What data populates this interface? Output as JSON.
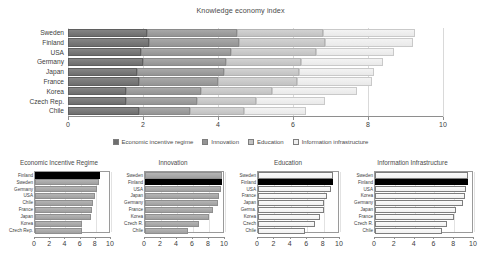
{
  "chart_data": [
    {
      "type": "bar",
      "title": "Knowledge economy index",
      "orientation": "horizontal",
      "stacked": true,
      "xlabel": "",
      "ylabel": "",
      "xlim": [
        0,
        10
      ],
      "xticks": [
        0,
        2,
        4,
        6,
        8,
        10
      ],
      "grid": true,
      "legend_position": "bottom",
      "categories": [
        "Sweden",
        "Finland",
        "USA",
        "Germany",
        "Japan",
        "France",
        "Korea",
        "Czech Rep.",
        "Chile"
      ],
      "series": [
        {
          "name": "Economic incentive regime",
          "color": "#6e6e6e",
          "values": [
            2.1,
            2.15,
            1.95,
            2.0,
            1.85,
            1.9,
            1.55,
            1.55,
            1.9
          ]
        },
        {
          "name": "Innovation",
          "color": "#949494",
          "values": [
            2.4,
            2.4,
            2.4,
            2.2,
            2.3,
            2.1,
            2.0,
            1.9,
            1.35
          ]
        },
        {
          "name": "Education",
          "color": "#c2c2c2",
          "values": [
            2.3,
            2.3,
            2.25,
            2.0,
            2.0,
            2.1,
            1.9,
            1.55,
            1.45
          ]
        },
        {
          "name": "Information infrastructure",
          "color": "#e9e9e9",
          "values": [
            2.45,
            2.35,
            2.1,
            2.2,
            2.0,
            2.0,
            2.25,
            1.85,
            1.65
          ]
        }
      ],
      "totals": [
        9.25,
        9.2,
        8.7,
        8.4,
        8.15,
        8.1,
        7.7,
        6.85,
        6.35
      ]
    },
    {
      "type": "bar",
      "title": "Economic Incentive Regime",
      "orientation": "horizontal",
      "xlim": [
        0,
        10
      ],
      "xticks": [
        0,
        2,
        4,
        6,
        8,
        10
      ],
      "highlight": "Finland",
      "categories": [
        "Finland",
        "Sweden",
        "Germany",
        "USA",
        "Chile",
        "France",
        "Japan",
        "Korea",
        "Czech Rep."
      ],
      "values": [
        8.6,
        8.4,
        8.1,
        7.9,
        7.6,
        7.5,
        7.4,
        6.2,
        6.2
      ]
    },
    {
      "type": "bar",
      "title": "Innovation",
      "orientation": "horizontal",
      "xlim": [
        0,
        10
      ],
      "xticks": [
        0,
        2,
        4,
        6,
        8,
        10
      ],
      "highlight": "Finland",
      "categories": [
        "Sweden",
        "Finland",
        "USA",
        "Japan",
        "Germany",
        "France",
        "Korea",
        "Czech R.",
        "Chile"
      ],
      "values": [
        9.6,
        9.6,
        9.5,
        9.3,
        9.1,
        8.5,
        8.0,
        6.7,
        5.4
      ]
    },
    {
      "type": "bar",
      "title": "Education",
      "orientation": "horizontal",
      "xlim": [
        0,
        10
      ],
      "xticks": [
        0,
        2,
        4,
        6,
        8,
        10
      ],
      "highlight": "Finland",
      "categories": [
        "Sweden",
        "Finland",
        "USA",
        "France",
        "Japan",
        "Germa.",
        "Korea",
        "Czech",
        "Chile"
      ],
      "values": [
        9.2,
        9.2,
        8.9,
        8.4,
        8.1,
        8.0,
        7.6,
        7.0,
        5.7
      ]
    },
    {
      "type": "bar",
      "title": "Information Infrastructure",
      "orientation": "horizontal",
      "xlim": [
        0,
        10
      ],
      "xticks": [
        0,
        2,
        4,
        6,
        8,
        10
      ],
      "highlight": "Finland",
      "categories": [
        "Sweden",
        "Finland",
        "USA",
        "Korea",
        "Germany",
        "Japan",
        "France",
        "Czech R.",
        "Chile"
      ],
      "values": [
        9.4,
        9.4,
        9.2,
        9.1,
        8.9,
        8.2,
        8.0,
        7.3,
        6.8
      ]
    }
  ],
  "main": {
    "title": "Knowledge economy index",
    "countries": [
      "Sweden",
      "Finland",
      "USA",
      "Germany",
      "Japan",
      "France",
      "Korea",
      "Czech Rep.",
      "Chile"
    ],
    "xticks": [
      "0",
      "2",
      "4",
      "6",
      "8",
      "10"
    ]
  },
  "legend": {
    "items": [
      {
        "label": "Economic incentive regime",
        "swatch": "#6e6e6e"
      },
      {
        "label": "Innovation",
        "swatch": "#949494"
      },
      {
        "label": "Education",
        "swatch": "#c2c2c2"
      },
      {
        "label": "Information infrastructure",
        "swatch": "#efefef"
      }
    ]
  },
  "subcharts": [
    {
      "title": "Economic Incentive Regime",
      "countries": [
        "Finland",
        "Sweden",
        "Germany",
        "USA",
        "Chile",
        "France",
        "Japan",
        "Korea",
        "Czech Rep."
      ],
      "xticks": [
        "0",
        "2",
        "4",
        "6",
        "8",
        "10"
      ]
    },
    {
      "title": "Innovation",
      "countries": [
        "Sweden",
        "Finland",
        "USA",
        "Japan",
        "Germany",
        "France",
        "Korea",
        "Czech R.",
        "Chile"
      ],
      "xticks": [
        "0",
        "2",
        "4",
        "6",
        "8",
        "10"
      ]
    },
    {
      "title": "Education",
      "countries": [
        "Sweden",
        "Finland",
        "USA",
        "France",
        "Japan",
        "Germa.",
        "Korea",
        "Czech",
        "Chile"
      ],
      "xticks": [
        "0",
        "2",
        "4",
        "6",
        "8",
        "10"
      ]
    },
    {
      "title": "Information Infrastructure",
      "countries": [
        "Sweden",
        "Finland",
        "USA",
        "Korea",
        "Germany",
        "Japan",
        "France",
        "Czech R.",
        "Chile"
      ],
      "xticks": [
        "0",
        "2",
        "4",
        "6",
        "8",
        "10"
      ]
    }
  ]
}
